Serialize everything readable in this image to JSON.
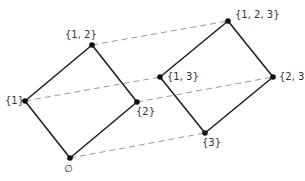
{
  "diagram": {
    "type": "hasse-diagram-cube",
    "colors": {
      "edge": "#222222",
      "dashed": "#999999",
      "node": "#111111",
      "label": "#333333"
    },
    "nodes": [
      {
        "id": "empty",
        "label": "∅",
        "x": 70,
        "y": 158,
        "lx": 64,
        "ly": 163
      },
      {
        "id": "1",
        "label": "{1}",
        "x": 25,
        "y": 101,
        "lx": 5,
        "ly": 95
      },
      {
        "id": "2",
        "label": "{2}",
        "x": 137,
        "y": 102,
        "lx": 136,
        "ly": 106
      },
      {
        "id": "12",
        "label": "{1, 2}",
        "x": 92,
        "y": 45,
        "lx": 65,
        "ly": 29
      },
      {
        "id": "3",
        "label": "{3}",
        "x": 205,
        "y": 133,
        "lx": 202,
        "ly": 137
      },
      {
        "id": "13",
        "label": "{1, 3}",
        "x": 160,
        "y": 77,
        "lx": 167,
        "ly": 71
      },
      {
        "id": "23",
        "label": "{2, 3}",
        "x": 273,
        "y": 77,
        "lx": 279,
        "ly": 71
      },
      {
        "id": "123",
        "label": "{1, 2, 3}",
        "x": 228,
        "y": 21,
        "lx": 235,
        "ly": 9
      }
    ],
    "solid_edges": [
      [
        "empty",
        "1"
      ],
      [
        "empty",
        "2"
      ],
      [
        "1",
        "12"
      ],
      [
        "2",
        "12"
      ],
      [
        "3",
        "13"
      ],
      [
        "3",
        "23"
      ],
      [
        "13",
        "123"
      ],
      [
        "23",
        "123"
      ]
    ],
    "dashed_edges": [
      [
        "empty",
        "3"
      ],
      [
        "1",
        "13"
      ],
      [
        "2",
        "23"
      ],
      [
        "12",
        "123"
      ]
    ]
  }
}
